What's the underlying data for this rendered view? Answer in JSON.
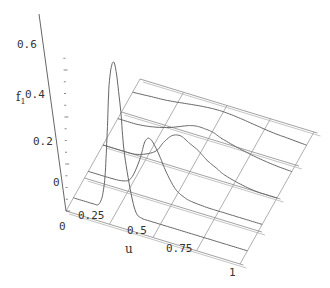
{
  "chart_data": {
    "type": "line",
    "subtype": "3d-slices",
    "title": "",
    "xlabel": "u",
    "zlabel": "f",
    "zlabel_subscript": "1",
    "x_ticks": [
      "0",
      "0.25",
      "0.5",
      "0.75",
      "1"
    ],
    "x_tick_values": [
      0,
      0.25,
      0.5,
      0.75,
      1
    ],
    "z_ticks": [
      "0",
      "0.2",
      "0.4",
      "0.6"
    ],
    "z_tick_values": [
      0,
      0.2,
      0.4,
      0.6
    ],
    "xlim": [
      0,
      1
    ],
    "zlim": [
      0,
      0.7
    ],
    "depth_slices": [
      0.0,
      0.25,
      0.5,
      0.75,
      1.0
    ],
    "grid": true,
    "series": [
      {
        "name": "slice-1",
        "depth": 0.1,
        "x": [
          0,
          0.1,
          0.15,
          0.18,
          0.2,
          0.22,
          0.25,
          0.28,
          0.3,
          0.35,
          0.4,
          0.5,
          0.6,
          0.7,
          0.8,
          0.9,
          1
        ],
        "values": [
          0,
          0,
          0.01,
          0.1,
          0.3,
          0.55,
          0.63,
          0.45,
          0.25,
          0.04,
          0,
          0,
          0,
          0,
          0,
          0,
          0
        ]
      },
      {
        "name": "slice-2",
        "depth": 0.3,
        "x": [
          0,
          0.1,
          0.2,
          0.25,
          0.3,
          0.33,
          0.36,
          0.4,
          0.45,
          0.5,
          0.55,
          0.6,
          0.7,
          0.8,
          0.9,
          1
        ],
        "values": [
          0,
          0,
          0.005,
          0.03,
          0.12,
          0.2,
          0.22,
          0.18,
          0.1,
          0.04,
          0.015,
          0.005,
          0,
          0,
          0,
          0
        ]
      },
      {
        "name": "slice-3",
        "depth": 0.5,
        "x": [
          0,
          0.1,
          0.2,
          0.3,
          0.35,
          0.4,
          0.45,
          0.5,
          0.55,
          0.6,
          0.65,
          0.7,
          0.8,
          0.9,
          1
        ],
        "values": [
          0,
          0,
          0.005,
          0.04,
          0.09,
          0.13,
          0.14,
          0.12,
          0.1,
          0.07,
          0.05,
          0.03,
          0.01,
          0,
          0
        ]
      },
      {
        "name": "slice-4",
        "depth": 0.7,
        "x": [
          0,
          0.1,
          0.2,
          0.3,
          0.4,
          0.45,
          0.5,
          0.55,
          0.6,
          0.7,
          0.8,
          0.9,
          1
        ],
        "values": [
          0,
          0,
          0.01,
          0.03,
          0.06,
          0.07,
          0.07,
          0.065,
          0.05,
          0.03,
          0.015,
          0.005,
          0
        ]
      },
      {
        "name": "slice-5",
        "depth": 0.9,
        "x": [
          0,
          0.1,
          0.2,
          0.3,
          0.4,
          0.5,
          0.6,
          0.7,
          0.8,
          0.9,
          1
        ],
        "values": [
          0,
          0.005,
          0.01,
          0.02,
          0.03,
          0.035,
          0.03,
          0.02,
          0.01,
          0.005,
          0
        ]
      }
    ]
  }
}
